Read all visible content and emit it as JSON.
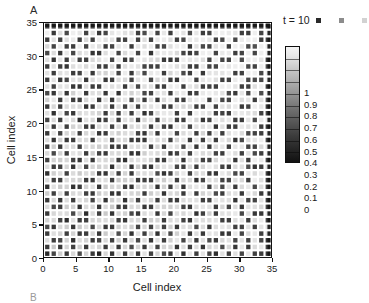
{
  "panels": {
    "a_label": "A",
    "b_label": "B"
  },
  "legend": {
    "time_label": "t = 10",
    "swatch_colors": [
      "#2a2a2a",
      "#8c8c8c",
      "#d2d2d2"
    ]
  },
  "colorbar": {
    "tick_labels": [
      "1",
      "0.9",
      "0.8",
      "0.7",
      "0.6",
      "0.5",
      "0.4",
      "0.3",
      "0.2",
      "0.1",
      "0"
    ],
    "min": 0,
    "max": 1,
    "low_color": "#111111",
    "high_color": "#f4f4f4"
  },
  "chart_data": {
    "type": "heatmap",
    "title": "",
    "xlabel": "Cell index",
    "ylabel": "Cell index",
    "xlim": [
      0,
      35
    ],
    "ylim": [
      0,
      35
    ],
    "xticks": [
      0,
      5,
      10,
      15,
      20,
      25,
      30,
      35
    ],
    "yticks": [
      0,
      5,
      10,
      15,
      20,
      25,
      30,
      35
    ],
    "xtick_labels": [
      "0",
      "5",
      "10",
      "15",
      "20",
      "25",
      "30",
      "35"
    ],
    "ytick_labels": [
      "0",
      "5",
      "10",
      "15",
      "20",
      "25",
      "30",
      "35"
    ],
    "grid": false,
    "legend_position": "top-right",
    "colormap": "gray",
    "vmin": 0,
    "vmax": 1,
    "n_rows": 35,
    "n_cols": 35,
    "cell_gap": true,
    "annotation": "t = 10",
    "values": [
      [
        0.15,
        0.22,
        0.88,
        0.18,
        0.92,
        0.25,
        0.85,
        0.2,
        0.12,
        0.9,
        0.18,
        0.95,
        0.22,
        0.88,
        0.15,
        0.92,
        0.2,
        0.86,
        0.24,
        0.18,
        0.9,
        0.16,
        0.94,
        0.2,
        0.88,
        0.22,
        0.15,
        0.92,
        0.18,
        0.86,
        0.24,
        0.9,
        0.16,
        0.2,
        0.18
      ],
      [
        0.2,
        0.85,
        0.18,
        0.9,
        0.22,
        0.88,
        0.16,
        0.92,
        0.86,
        0.2,
        0.94,
        0.18,
        0.9,
        0.24,
        0.88,
        0.18,
        0.92,
        0.22,
        0.86,
        0.9,
        0.16,
        0.88,
        0.2,
        0.92,
        0.18,
        0.86,
        0.9,
        0.22,
        0.88,
        0.18,
        0.92,
        0.2,
        0.86,
        0.9,
        0.24
      ],
      [
        0.9,
        0.18,
        0.22,
        0.86,
        0.16,
        0.92,
        0.88,
        0.18,
        0.24,
        0.9,
        0.2,
        0.86,
        0.18,
        0.92,
        0.22,
        0.88,
        0.16,
        0.9,
        0.18,
        0.86,
        0.92,
        0.2,
        0.88,
        0.16,
        0.9,
        0.24,
        0.18,
        0.86,
        0.92,
        0.2,
        0.88,
        0.18,
        0.9,
        0.22,
        0.16
      ],
      [
        0.18,
        0.92,
        0.86,
        0.2,
        0.88,
        0.18,
        0.22,
        0.9,
        0.16,
        0.86,
        0.92,
        0.24,
        0.88,
        0.18,
        0.9,
        0.2,
        0.86,
        0.16,
        0.92,
        0.22,
        0.88,
        0.9,
        0.18,
        0.86,
        0.2,
        0.92,
        0.88,
        0.16,
        0.18,
        0.9,
        0.22,
        0.86,
        0.92,
        0.18,
        0.88
      ],
      [
        0.24,
        0.16,
        0.9,
        0.88,
        0.18,
        0.86,
        0.92,
        0.22,
        0.9,
        0.18,
        0.16,
        0.88,
        0.92,
        0.86,
        0.2,
        0.9,
        0.24,
        0.88,
        0.18,
        0.86,
        0.2,
        0.92,
        0.9,
        0.22,
        0.88,
        0.16,
        0.86,
        0.9,
        0.92,
        0.18,
        0.2,
        0.88,
        0.16,
        0.9,
        0.86
      ],
      [
        0.88,
        0.9,
        0.2,
        0.16,
        0.92,
        0.22,
        0.18,
        0.86,
        0.88,
        0.92,
        0.9,
        0.2,
        0.16,
        0.88,
        0.92,
        0.18,
        0.86,
        0.9,
        0.22,
        0.88,
        0.92,
        0.18,
        0.16,
        0.9,
        0.86,
        0.88,
        0.92,
        0.2,
        0.18,
        0.86,
        0.9,
        0.16,
        0.88,
        0.92,
        0.22
      ],
      [
        0.18,
        0.86,
        0.92,
        0.9,
        0.22,
        0.88,
        0.16,
        0.9,
        0.2,
        0.86,
        0.18,
        0.92,
        0.88,
        0.22,
        0.16,
        0.9,
        0.92,
        0.18,
        0.86,
        0.2,
        0.88,
        0.9,
        0.92,
        0.16,
        0.18,
        0.86,
        0.2,
        0.88,
        0.9,
        0.92,
        0.22,
        0.86,
        0.18,
        0.16,
        0.9
      ],
      [
        0.92,
        0.22,
        0.18,
        0.86,
        0.9,
        0.16,
        0.88,
        0.92,
        0.18,
        0.9,
        0.86,
        0.22,
        0.2,
        0.88,
        0.9,
        0.16,
        0.18,
        0.92,
        0.88,
        0.86,
        0.9,
        0.22,
        0.18,
        0.88,
        0.92,
        0.9,
        0.16,
        0.86,
        0.2,
        0.88,
        0.18,
        0.92,
        0.9,
        0.86,
        0.22
      ],
      [
        0.2,
        0.88,
        0.16,
        0.92,
        0.18,
        0.9,
        0.86,
        0.2,
        0.92,
        0.16,
        0.88,
        0.9,
        0.18,
        0.86,
        0.22,
        0.92,
        0.88,
        0.2,
        0.9,
        0.18,
        0.16,
        0.86,
        0.88,
        0.92,
        0.2,
        0.18,
        0.9,
        0.92,
        0.86,
        0.16,
        0.88,
        0.2,
        0.22,
        0.9,
        0.18
      ],
      [
        0.86,
        0.18,
        0.9,
        0.2,
        0.88,
        0.92,
        0.22,
        0.18,
        0.86,
        0.9,
        0.2,
        0.16,
        0.92,
        0.9,
        0.88,
        0.18,
        0.86,
        0.92,
        0.16,
        0.9,
        0.88,
        0.2,
        0.92,
        0.18,
        0.86,
        0.9,
        0.22,
        0.18,
        0.88,
        0.92,
        0.16,
        0.9,
        0.86,
        0.18,
        0.92
      ],
      [
        0.18,
        0.92,
        0.86,
        0.88,
        0.16,
        0.2,
        0.9,
        0.92,
        0.18,
        0.86,
        0.88,
        0.92,
        0.2,
        0.18,
        0.9,
        0.86,
        0.92,
        0.16,
        0.88,
        0.22,
        0.9,
        0.18,
        0.86,
        0.9,
        0.92,
        0.16,
        0.88,
        0.2,
        0.9,
        0.18,
        0.86,
        0.92,
        0.2,
        0.88,
        0.16
      ],
      [
        0.9,
        0.2,
        0.18,
        0.92,
        0.86,
        0.88,
        0.16,
        0.2,
        0.9,
        0.92,
        0.18,
        0.86,
        0.88,
        0.92,
        0.16,
        0.2,
        0.18,
        0.9,
        0.86,
        0.92,
        0.18,
        0.88,
        0.9,
        0.16,
        0.22,
        0.86,
        0.92,
        0.18,
        0.2,
        0.9,
        0.88,
        0.16,
        0.92,
        0.86,
        0.2
      ],
      [
        0.16,
        0.88,
        0.92,
        0.18,
        0.9,
        0.86,
        0.92,
        0.88,
        0.16,
        0.2,
        0.9,
        0.18,
        0.86,
        0.2,
        0.92,
        0.88,
        0.9,
        0.22,
        0.18,
        0.16,
        0.86,
        0.92,
        0.2,
        0.88,
        0.9,
        0.18,
        0.16,
        0.92,
        0.86,
        0.2,
        0.18,
        0.9,
        0.88,
        0.92,
        0.16
      ],
      [
        0.92,
        0.16,
        0.2,
        0.86,
        0.18,
        0.92,
        0.2,
        0.9,
        0.88,
        0.86,
        0.16,
        0.92,
        0.9,
        0.18,
        0.86,
        0.2,
        0.16,
        0.88,
        0.92,
        0.9,
        0.22,
        0.18,
        0.86,
        0.16,
        0.88,
        0.92,
        0.9,
        0.2,
        0.18,
        0.86,
        0.92,
        0.22,
        0.16,
        0.2,
        0.88
      ],
      [
        0.2,
        0.9,
        0.86,
        0.92,
        0.2,
        0.16,
        0.88,
        0.18,
        0.92,
        0.9,
        0.86,
        0.2,
        0.16,
        0.88,
        0.92,
        0.9,
        0.86,
        0.18,
        0.2,
        0.88,
        0.92,
        0.16,
        0.9,
        0.86,
        0.18,
        0.2,
        0.88,
        0.92,
        0.9,
        0.16,
        0.86,
        0.18,
        0.92,
        0.88,
        0.2
      ],
      [
        0.86,
        0.22,
        0.9,
        0.18,
        0.92,
        0.88,
        0.16,
        0.86,
        0.2,
        0.18,
        0.92,
        0.88,
        0.9,
        0.16,
        0.18,
        0.86,
        0.92,
        0.9,
        0.88,
        0.16,
        0.2,
        0.9,
        0.18,
        0.92,
        0.86,
        0.88,
        0.2,
        0.16,
        0.92,
        0.9,
        0.18,
        0.86,
        0.2,
        0.16,
        0.92
      ],
      [
        0.18,
        0.86,
        0.16,
        0.9,
        0.88,
        0.2,
        0.92,
        0.9,
        0.86,
        0.88,
        0.18,
        0.16,
        0.2,
        0.92,
        0.9,
        0.88,
        0.18,
        0.86,
        0.16,
        0.92,
        0.88,
        0.2,
        0.9,
        0.18,
        0.92,
        0.16,
        0.86,
        0.88,
        0.2,
        0.92,
        0.9,
        0.16,
        0.18,
        0.86,
        0.9
      ],
      [
        0.9,
        0.18,
        0.88,
        0.2,
        0.16,
        0.92,
        0.86,
        0.18,
        0.9,
        0.92,
        0.2,
        0.88,
        0.86,
        0.18,
        0.16,
        0.2,
        0.92,
        0.88,
        0.9,
        0.18,
        0.86,
        0.92,
        0.16,
        0.88,
        0.2,
        0.9,
        0.18,
        0.92,
        0.86,
        0.16,
        0.2,
        0.88,
        0.92,
        0.9,
        0.18
      ],
      [
        0.16,
        0.92,
        0.2,
        0.86,
        0.9,
        0.18,
        0.88,
        0.92,
        0.16,
        0.2,
        0.9,
        0.86,
        0.92,
        0.88,
        0.2,
        0.18,
        0.86,
        0.16,
        0.92,
        0.9,
        0.18,
        0.88,
        0.92,
        0.2,
        0.86,
        0.18,
        0.9,
        0.16,
        0.88,
        0.92,
        0.86,
        0.2,
        0.18,
        0.16,
        0.9
      ],
      [
        0.88,
        0.2,
        0.92,
        0.18,
        0.86,
        0.9,
        0.2,
        0.16,
        0.88,
        0.92,
        0.18,
        0.9,
        0.16,
        0.86,
        0.92,
        0.88,
        0.2,
        0.9,
        0.18,
        0.16,
        0.92,
        0.86,
        0.2,
        0.9,
        0.88,
        0.92,
        0.16,
        0.86,
        0.18,
        0.2,
        0.92,
        0.9,
        0.88,
        0.18,
        0.16
      ],
      [
        0.2,
        0.86,
        0.18,
        0.92,
        0.88,
        0.16,
        0.9,
        0.86,
        0.2,
        0.18,
        0.92,
        0.16,
        0.88,
        0.9,
        0.18,
        0.86,
        0.92,
        0.2,
        0.88,
        0.9,
        0.16,
        0.18,
        0.92,
        0.86,
        0.16,
        0.2,
        0.9,
        0.88,
        0.92,
        0.18,
        0.16,
        0.86,
        0.2,
        0.92,
        0.88
      ],
      [
        0.92,
        0.16,
        0.9,
        0.2,
        0.18,
        0.88,
        0.92,
        0.9,
        0.86,
        0.16,
        0.88,
        0.2,
        0.92,
        0.18,
        0.9,
        0.16,
        0.2,
        0.86,
        0.92,
        0.88,
        0.18,
        0.9,
        0.16,
        0.92,
        0.88,
        0.86,
        0.2,
        0.18,
        0.16,
        0.9,
        0.92,
        0.88,
        0.86,
        0.16,
        0.2
      ],
      [
        0.18,
        0.88,
        0.2,
        0.86,
        0.92,
        0.9,
        0.16,
        0.18,
        0.92,
        0.88,
        0.2,
        0.86,
        0.18,
        0.92,
        0.16,
        0.9,
        0.88,
        0.92,
        0.16,
        0.2,
        0.9,
        0.86,
        0.88,
        0.18,
        0.2,
        0.92,
        0.16,
        0.9,
        0.86,
        0.88,
        0.18,
        0.2,
        0.92,
        0.9,
        0.16
      ],
      [
        0.86,
        0.92,
        0.16,
        0.9,
        0.2,
        0.18,
        0.88,
        0.92,
        0.18,
        0.9,
        0.16,
        0.88,
        0.92,
        0.2,
        0.86,
        0.18,
        0.9,
        0.16,
        0.88,
        0.92,
        0.2,
        0.18,
        0.86,
        0.9,
        0.92,
        0.16,
        0.88,
        0.2,
        0.18,
        0.92,
        0.86,
        0.9,
        0.16,
        0.88,
        0.2
      ],
      [
        0.2,
        0.18,
        0.88,
        0.16,
        0.86,
        0.92,
        0.2,
        0.88,
        0.9,
        0.18,
        0.92,
        0.16,
        0.9,
        0.86,
        0.92,
        0.2,
        0.18,
        0.88,
        0.9,
        0.16,
        0.86,
        0.92,
        0.18,
        0.16,
        0.88,
        0.9,
        0.92,
        0.86,
        0.2,
        0.16,
        0.88,
        0.18,
        0.92,
        0.2,
        0.9
      ],
      [
        0.9,
        0.2,
        0.92,
        0.88,
        0.18,
        0.16,
        0.86,
        0.2,
        0.16,
        0.92,
        0.88,
        0.9,
        0.18,
        0.92,
        0.2,
        0.86,
        0.88,
        0.16,
        0.2,
        0.9,
        0.92,
        0.18,
        0.88,
        0.86,
        0.16,
        0.2,
        0.18,
        0.92,
        0.9,
        0.88,
        0.2,
        0.16,
        0.86,
        0.92,
        0.18
      ],
      [
        0.16,
        0.9,
        0.18,
        0.2,
        0.92,
        0.88,
        0.18,
        0.86,
        0.92,
        0.2,
        0.16,
        0.88,
        0.86,
        0.18,
        0.9,
        0.92,
        0.2,
        0.86,
        0.88,
        0.18,
        0.16,
        0.9,
        0.92,
        0.2,
        0.9,
        0.88,
        0.86,
        0.16,
        0.18,
        0.92,
        0.9,
        0.2,
        0.18,
        0.16,
        0.88
      ],
      [
        0.92,
        0.18,
        0.86,
        0.9,
        0.16,
        0.2,
        0.92,
        0.18,
        0.88,
        0.86,
        0.9,
        0.2,
        0.92,
        0.16,
        0.88,
        0.18,
        0.9,
        0.92,
        0.16,
        0.86,
        0.88,
        0.2,
        0.18,
        0.92,
        0.16,
        0.86,
        0.9,
        0.88,
        0.92,
        0.2,
        0.16,
        0.9,
        0.88,
        0.18,
        0.86
      ],
      [
        0.18,
        0.92,
        0.2,
        0.16,
        0.88,
        0.9,
        0.86,
        0.92,
        0.2,
        0.18,
        0.88,
        0.16,
        0.9,
        0.92,
        0.86,
        0.2,
        0.16,
        0.18,
        0.92,
        0.9,
        0.88,
        0.86,
        0.2,
        0.18,
        0.92,
        0.16,
        0.2,
        0.9,
        0.86,
        0.88,
        0.92,
        0.18,
        0.16,
        0.9,
        0.2
      ],
      [
        0.88,
        0.16,
        0.92,
        0.18,
        0.9,
        0.2,
        0.16,
        0.88,
        0.86,
        0.92,
        0.2,
        0.9,
        0.18,
        0.2,
        0.92,
        0.88,
        0.9,
        0.86,
        0.18,
        0.16,
        0.2,
        0.92,
        0.88,
        0.9,
        0.86,
        0.18,
        0.92,
        0.16,
        0.2,
        0.9,
        0.18,
        0.88,
        0.92,
        0.86,
        0.16
      ],
      [
        0.2,
        0.88,
        0.16,
        0.92,
        0.2,
        0.86,
        0.9,
        0.16,
        0.18,
        0.88,
        0.92,
        0.2,
        0.86,
        0.9,
        0.18,
        0.92,
        0.16,
        0.88,
        0.9,
        0.92,
        0.86,
        0.18,
        0.16,
        0.2,
        0.88,
        0.92,
        0.18,
        0.86,
        0.9,
        0.16,
        0.2,
        0.92,
        0.18,
        0.88,
        0.9
      ],
      [
        0.86,
        0.2,
        0.9,
        0.16,
        0.18,
        0.92,
        0.2,
        0.9,
        0.88,
        0.16,
        0.18,
        0.86,
        0.92,
        0.16,
        0.9,
        0.88,
        0.92,
        0.2,
        0.18,
        0.86,
        0.9,
        0.92,
        0.16,
        0.88,
        0.18,
        0.2,
        0.86,
        0.92,
        0.16,
        0.88,
        0.9,
        0.18,
        0.2,
        0.92,
        0.86
      ],
      [
        0.18,
        0.92,
        0.18,
        0.88,
        0.9,
        0.16,
        0.86,
        0.2,
        0.92,
        0.9,
        0.88,
        0.18,
        0.2,
        0.92,
        0.16,
        0.86,
        0.18,
        0.9,
        0.92,
        0.88,
        0.16,
        0.2,
        0.9,
        0.86,
        0.92,
        0.88,
        0.16,
        0.18,
        0.92,
        0.2,
        0.86,
        0.9,
        0.88,
        0.16,
        0.18
      ],
      [
        0.92,
        0.16,
        0.86,
        0.2,
        0.92,
        0.88,
        0.18,
        0.9,
        0.16,
        0.2,
        0.86,
        0.92,
        0.9,
        0.88,
        0.18,
        0.2,
        0.92,
        0.16,
        0.86,
        0.18,
        0.92,
        0.88,
        0.2,
        0.9,
        0.16,
        0.18,
        0.92,
        0.9,
        0.86,
        0.88,
        0.18,
        0.16,
        0.92,
        0.2,
        0.9
      ],
      [
        0.2,
        0.18,
        0.22,
        0.16,
        0.2,
        0.18,
        0.24,
        0.16,
        0.2,
        0.18,
        0.22,
        0.16,
        0.2,
        0.18,
        0.22,
        0.16,
        0.18,
        0.2,
        0.16,
        0.22,
        0.18,
        0.2,
        0.16,
        0.18,
        0.22,
        0.2,
        0.16,
        0.18,
        0.2,
        0.22,
        0.16,
        0.18,
        0.2,
        0.16,
        0.18
      ]
    ]
  }
}
